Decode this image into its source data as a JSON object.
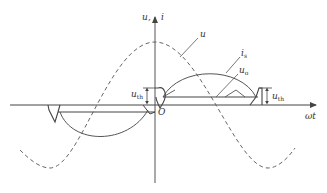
{
  "figure": {
    "type": "waveform-diagram",
    "colors": {
      "axis": "#444444",
      "curve": "#555555",
      "dashed": "#666666",
      "background": "#ffffff"
    },
    "axes": {
      "y_label_u": "u",
      "y_label_sep": ",",
      "y_label_i": "i",
      "x_label": "ωt",
      "origin_label": "O"
    },
    "curves": [
      {
        "id": "u",
        "label": "u",
        "style": "dashed",
        "description": "source voltage (cosine)"
      },
      {
        "id": "is",
        "label_main": "i",
        "label_sub": "s",
        "style": "solid",
        "description": "source current half-sine pulses"
      },
      {
        "id": "uo",
        "label_main": "u",
        "label_sub": "o",
        "style": "solid",
        "description": "output voltage level"
      }
    ],
    "annotations": {
      "uth_left_main": "u",
      "uth_left_sub": "th",
      "uth_right_main": "u",
      "uth_right_sub": "th"
    }
  }
}
